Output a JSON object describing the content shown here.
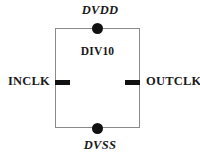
{
  "diagram": {
    "block": {
      "name": "DIV10"
    },
    "ports": {
      "supply_top": "DVDD",
      "supply_bottom": "DVSS",
      "input_left": "INCLK",
      "output_right": "OUTCLK"
    },
    "colors": {
      "background": "#ffffff",
      "block_outline": "#8a8a8a",
      "pin_fill": "#111111",
      "text": "#1a1a1a"
    },
    "terminals": [
      {
        "id": "dvdd-terminal",
        "shape": "filled-circle",
        "edge": "top"
      },
      {
        "id": "dvss-terminal",
        "shape": "filled-circle",
        "edge": "bottom"
      },
      {
        "id": "inclk-terminal",
        "shape": "filled-bar",
        "edge": "left"
      },
      {
        "id": "outclk-terminal",
        "shape": "filled-bar",
        "edge": "right"
      }
    ]
  }
}
